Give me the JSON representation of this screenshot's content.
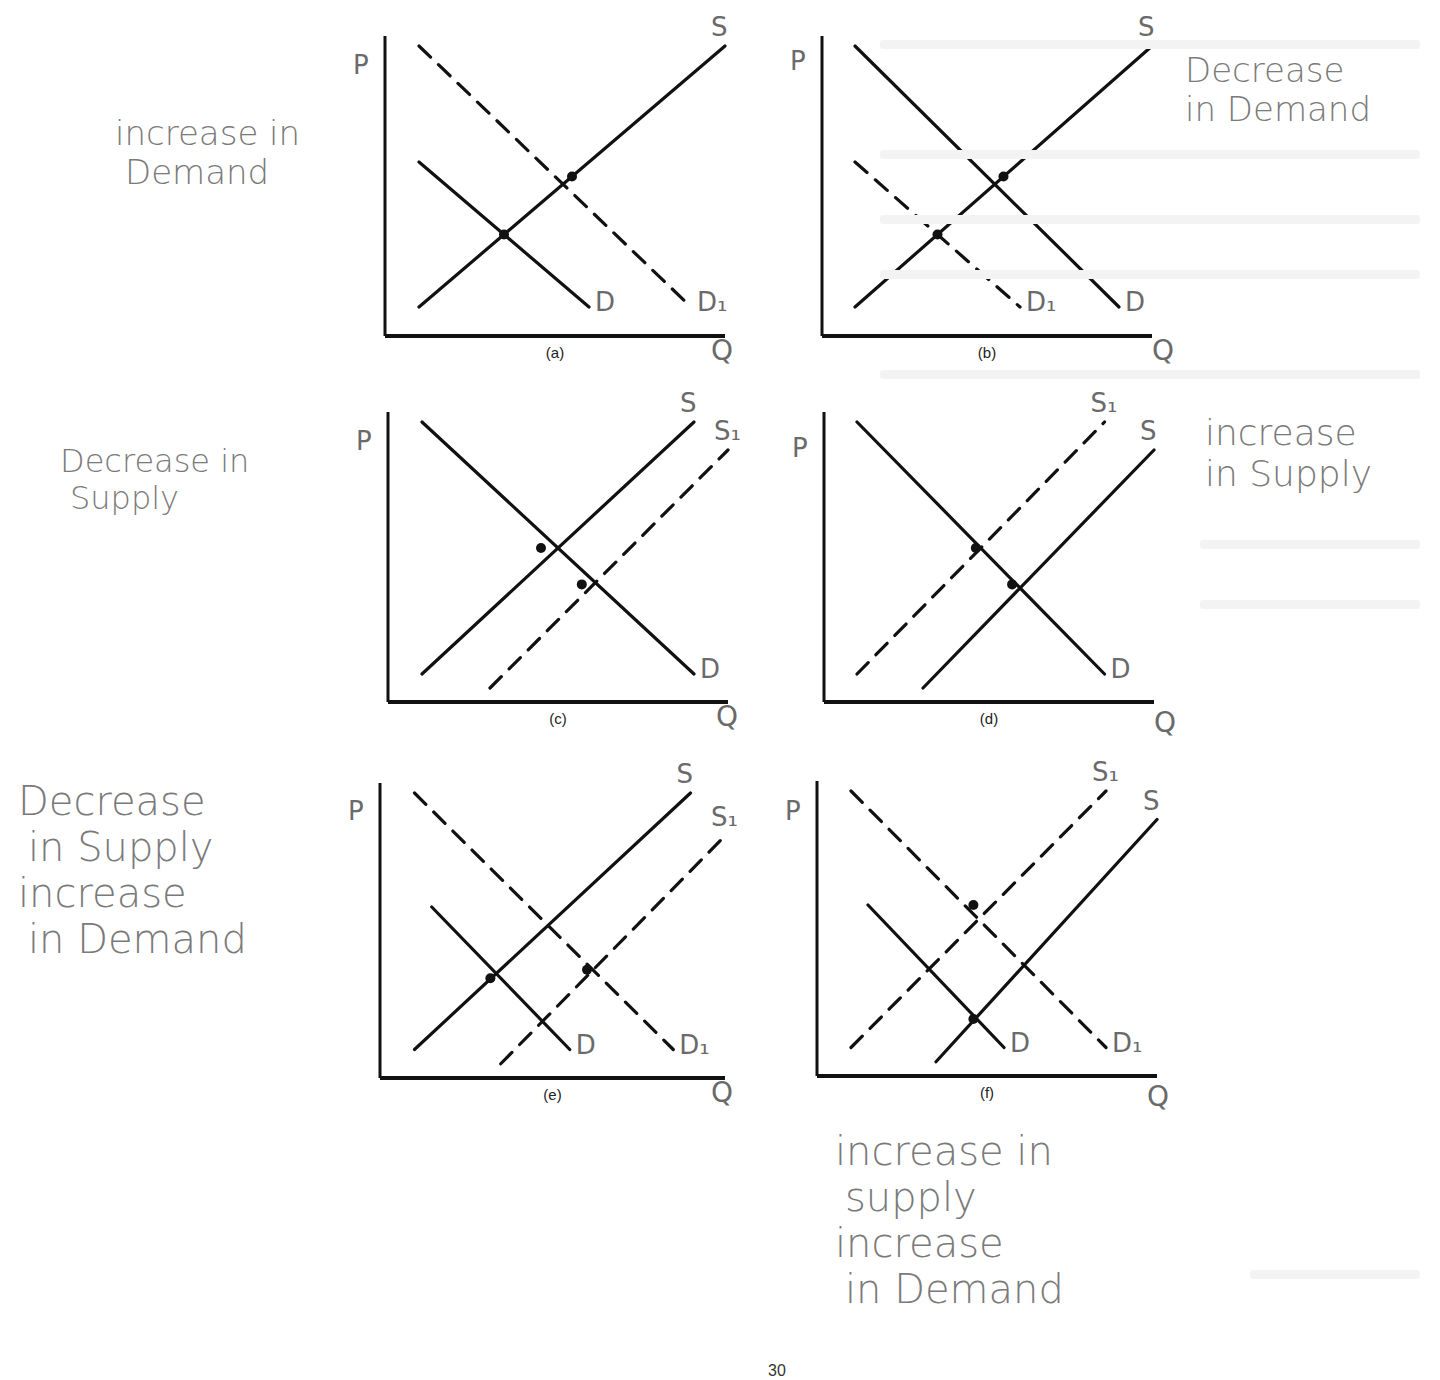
{
  "page": {
    "ink_color": "#111111",
    "pencil_color": "#777777",
    "page_number": "30"
  },
  "chart_data": [
    {
      "type": "line",
      "id": "a",
      "caption": "(a)",
      "xlabel": "Q",
      "ylabel": "P",
      "handwritten_answer": [
        "increase in",
        "Demand"
      ],
      "series": [
        {
          "name": "S",
          "style": "solid",
          "points": [
            [
              0.1,
              0.1
            ],
            [
              1.0,
              1.0
            ]
          ]
        },
        {
          "name": "D",
          "style": "solid",
          "points": [
            [
              0.1,
              0.6
            ],
            [
              0.6,
              0.1
            ]
          ]
        },
        {
          "name": "D1",
          "label": "D₁",
          "style": "dashed",
          "points": [
            [
              0.1,
              1.0
            ],
            [
              0.9,
              0.1
            ]
          ]
        }
      ],
      "equilibria": [
        [
          0.35,
          0.35
        ],
        [
          0.55,
          0.55
        ]
      ]
    },
    {
      "type": "line",
      "id": "b",
      "caption": "(b)",
      "xlabel": "Q",
      "ylabel": "P",
      "handwritten_answer": [
        "Decrease",
        "in Demand"
      ],
      "series": [
        {
          "name": "S",
          "style": "solid",
          "points": [
            [
              0.1,
              0.1
            ],
            [
              1.0,
              1.0
            ]
          ]
        },
        {
          "name": "D",
          "style": "solid",
          "points": [
            [
              0.1,
              1.0
            ],
            [
              0.9,
              0.1
            ]
          ]
        },
        {
          "name": "D1",
          "label": "D₁",
          "style": "dashed",
          "points": [
            [
              0.1,
              0.6
            ],
            [
              0.6,
              0.1
            ]
          ]
        }
      ],
      "equilibria": [
        [
          0.35,
          0.35
        ],
        [
          0.55,
          0.55
        ]
      ]
    },
    {
      "type": "line",
      "id": "c",
      "caption": "(c)",
      "xlabel": "Q",
      "ylabel": "P",
      "handwritten_answer": [
        "Decrease in",
        "Supply"
      ],
      "series": [
        {
          "name": "S",
          "style": "solid",
          "points": [
            [
              0.1,
              0.1
            ],
            [
              0.9,
              1.0
            ]
          ]
        },
        {
          "name": "S1",
          "label": "S₁",
          "style": "dashed",
          "points": [
            [
              0.3,
              0.05
            ],
            [
              1.0,
              0.9
            ]
          ]
        },
        {
          "name": "D",
          "style": "solid",
          "points": [
            [
              0.1,
              1.0
            ],
            [
              0.9,
              0.1
            ]
          ]
        }
      ],
      "equilibria": [
        [
          0.45,
          0.55
        ],
        [
          0.57,
          0.42
        ]
      ]
    },
    {
      "type": "line",
      "id": "d",
      "caption": "(d)",
      "xlabel": "Q",
      "ylabel": "P",
      "handwritten_answer": [
        "increase",
        "in Supply"
      ],
      "series": [
        {
          "name": "S",
          "style": "solid",
          "points": [
            [
              0.3,
              0.05
            ],
            [
              1.0,
              0.9
            ]
          ]
        },
        {
          "name": "S1",
          "label": "S₁",
          "style": "dashed",
          "points": [
            [
              0.1,
              0.1
            ],
            [
              0.85,
              1.0
            ]
          ]
        },
        {
          "name": "D",
          "style": "solid",
          "points": [
            [
              0.1,
              1.0
            ],
            [
              0.85,
              0.1
            ]
          ]
        }
      ],
      "equilibria": [
        [
          0.46,
          0.55
        ],
        [
          0.57,
          0.42
        ]
      ]
    },
    {
      "type": "line",
      "id": "e",
      "caption": "(e)",
      "xlabel": "Q",
      "ylabel": "P",
      "handwritten_answer": [
        "Decrease",
        "in Supply",
        "increase",
        "in Demand"
      ],
      "series": [
        {
          "name": "S",
          "style": "solid",
          "points": [
            [
              0.1,
              0.1
            ],
            [
              0.9,
              1.0
            ]
          ]
        },
        {
          "name": "S1",
          "label": "S₁",
          "style": "dashed",
          "points": [
            [
              0.35,
              0.05
            ],
            [
              1.0,
              0.85
            ]
          ]
        },
        {
          "name": "D",
          "style": "solid",
          "points": [
            [
              0.15,
              0.6
            ],
            [
              0.55,
              0.1
            ]
          ]
        },
        {
          "name": "D1",
          "label": "D₁",
          "style": "dashed",
          "points": [
            [
              0.1,
              1.0
            ],
            [
              0.85,
              0.1
            ]
          ]
        }
      ],
      "equilibria": [
        [
          0.32,
          0.35
        ],
        [
          0.6,
          0.38
        ]
      ]
    },
    {
      "type": "line",
      "id": "f",
      "caption": "(f)",
      "xlabel": "Q",
      "ylabel": "P",
      "handwritten_answer": [
        "increase in",
        "supply",
        "increase",
        "in Demand"
      ],
      "series": [
        {
          "name": "S",
          "style": "solid",
          "points": [
            [
              0.35,
              0.05
            ],
            [
              1.0,
              0.9
            ]
          ]
        },
        {
          "name": "S1",
          "label": "S₁",
          "style": "dashed",
          "points": [
            [
              0.1,
              0.1
            ],
            [
              0.85,
              1.0
            ]
          ]
        },
        {
          "name": "D",
          "style": "solid",
          "points": [
            [
              0.15,
              0.6
            ],
            [
              0.55,
              0.1
            ]
          ]
        },
        {
          "name": "D1",
          "label": "D₁",
          "style": "dashed",
          "points": [
            [
              0.1,
              1.0
            ],
            [
              0.85,
              0.1
            ]
          ]
        }
      ],
      "equilibria": [
        [
          0.46,
          0.6
        ],
        [
          0.46,
          0.2
        ]
      ]
    }
  ]
}
